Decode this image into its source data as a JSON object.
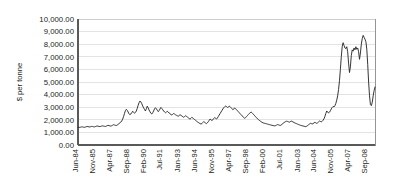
{
  "chart_data": {
    "type": "line",
    "title": "",
    "xlabel": "",
    "ylabel": "$ per tonne",
    "ylim": [
      0,
      10000
    ],
    "grid": true,
    "legend": false,
    "legend_position": "none",
    "series_color": "#2b2b2b",
    "gridline_color": "#dcdcdc",
    "plot_border_color": "#8a8a8a",
    "axis_color": "#595959",
    "background_color": "#ffffff",
    "y_ticks": [
      "0.00",
      "1,000.00",
      "2,000.00",
      "3,000.00",
      "4,000.00",
      "5,000.00",
      "6,000.00",
      "7,000.00",
      "8,000.00",
      "9,000.00",
      "10,000.00"
    ],
    "y_tick_values": [
      0,
      1000,
      2000,
      3000,
      4000,
      5000,
      6000,
      7000,
      8000,
      9000,
      10000
    ],
    "x_tick_labels": [
      "Jun-84",
      "Nov-85",
      "Apr-87",
      "Sep-88",
      "Feb-90",
      "Jul-91",
      "Jan-93",
      "Jun-94",
      "Nov-95",
      "Apr-97",
      "Sep-98",
      "Feb-00",
      "Jul-01",
      "Jan-03",
      "Jun-04",
      "Nov-05",
      "Apr-07",
      "Sep-08"
    ],
    "x_tick_index": [
      0,
      17,
      34,
      51,
      68,
      85,
      103,
      120,
      137,
      154,
      171,
      188,
      205,
      223,
      240,
      257,
      274,
      291
    ],
    "n_points": 300,
    "values": [
      1400,
      1410,
      1395,
      1420,
      1440,
      1430,
      1415,
      1405,
      1420,
      1450,
      1470,
      1460,
      1440,
      1430,
      1455,
      1480,
      1465,
      1445,
      1435,
      1460,
      1490,
      1510,
      1495,
      1475,
      1460,
      1480,
      1505,
      1520,
      1500,
      1485,
      1470,
      1495,
      1530,
      1560,
      1545,
      1520,
      1500,
      1525,
      1570,
      1610,
      1590,
      1560,
      1545,
      1580,
      1640,
      1700,
      1760,
      1820,
      1900,
      2050,
      2250,
      2500,
      2720,
      2830,
      2760,
      2620,
      2480,
      2400,
      2460,
      2560,
      2680,
      2600,
      2520,
      2580,
      2700,
      2900,
      3150,
      3350,
      3490,
      3420,
      3280,
      3100,
      2950,
      2820,
      2700,
      2880,
      3080,
      2950,
      2780,
      2640,
      2520,
      2460,
      2560,
      2700,
      2860,
      2960,
      2880,
      2760,
      2650,
      2720,
      2860,
      2980,
      2900,
      2800,
      2700,
      2620,
      2560,
      2600,
      2680,
      2620,
      2540,
      2480,
      2420,
      2380,
      2440,
      2500,
      2460,
      2400,
      2360,
      2320,
      2280,
      2340,
      2400,
      2360,
      2300,
      2250,
      2200,
      2260,
      2320,
      2280,
      2220,
      2160,
      2100,
      2050,
      2120,
      2200,
      2140,
      2080,
      2020,
      1960,
      1900,
      1840,
      1790,
      1740,
      1700,
      1660,
      1700,
      1780,
      1860,
      1800,
      1740,
      1700,
      1760,
      1850,
      1960,
      2060,
      2000,
      1940,
      2000,
      2100,
      2180,
      2120,
      2060,
      2140,
      2260,
      2380,
      2500,
      2620,
      2740,
      2860,
      2960,
      3040,
      3090,
      3050,
      2980,
      3020,
      3080,
      3040,
      2960,
      2880,
      2800,
      2860,
      2940,
      2880,
      2800,
      2720,
      2640,
      2560,
      2480,
      2400,
      2320,
      2250,
      2180,
      2120,
      2180,
      2260,
      2340,
      2420,
      2500,
      2560,
      2620,
      2560,
      2480,
      2400,
      2320,
      2240,
      2160,
      2080,
      2020,
      1960,
      1900,
      1850,
      1800,
      1760,
      1740,
      1720,
      1700,
      1680,
      1660,
      1640,
      1620,
      1600,
      1580,
      1560,
      1545,
      1530,
      1520,
      1540,
      1580,
      1620,
      1600,
      1570,
      1550,
      1590,
      1650,
      1710,
      1770,
      1820,
      1860,
      1890,
      1870,
      1840,
      1810,
      1850,
      1900,
      1870,
      1830,
      1790,
      1750,
      1720,
      1690,
      1660,
      1630,
      1600,
      1570,
      1545,
      1530,
      1510,
      1490,
      1470,
      1460,
      1490,
      1540,
      1600,
      1660,
      1720,
      1700,
      1670,
      1700,
      1750,
      1800,
      1760,
      1720,
      1760,
      1830,
      1900,
      1870,
      1840,
      1880,
      1960,
      2080,
      2260,
      2500,
      2700,
      2620,
      2540,
      2600,
      2720,
      2860,
      2980,
      3060,
      3020,
      3120,
      3300,
      3560,
      3900,
      4400,
      5100,
      6000,
      7000,
      7800,
      8120,
      7900,
      7700,
      7650,
      7800,
      7400,
      6500,
      5750,
      6200,
      7100,
      7550,
      7450,
      7700,
      7550,
      7800,
      7600,
      7700,
      7400,
      6800,
      7300,
      8000,
      8450,
      8700,
      8550,
      8400,
      8200,
      7600,
      6400,
      5000,
      3900,
      3200,
      3120,
      3400,
      3900,
      4300,
      4600
    ]
  }
}
